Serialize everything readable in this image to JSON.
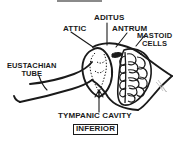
{
  "figure": {
    "kind": "anatomical-line-diagram",
    "background_color": "#ffffff",
    "ink_color": "#1a1a1a"
  },
  "labels": {
    "attic": "ATTIC",
    "aditus": "ADITUS",
    "antrum": "ANTRUM",
    "mastoid_cells_line1": "MASTOID",
    "mastoid_cells_line2": "CELLS",
    "eustachian_line1": "EUSTACHIAN",
    "eustachian_line2": "TUBE",
    "tympanic_cavity": "TYMPANIC CAVITY",
    "inferior": "INFERIOR"
  },
  "structures": {
    "tympanic_cavity": "tympanic-cavity",
    "mastoid_cells": "mastoid-air-cells",
    "eustachian_tube": "eustachian-tube",
    "aditus_passage": "aditus-ad-antrum",
    "skull_outline": "temporal-bone-outline"
  }
}
